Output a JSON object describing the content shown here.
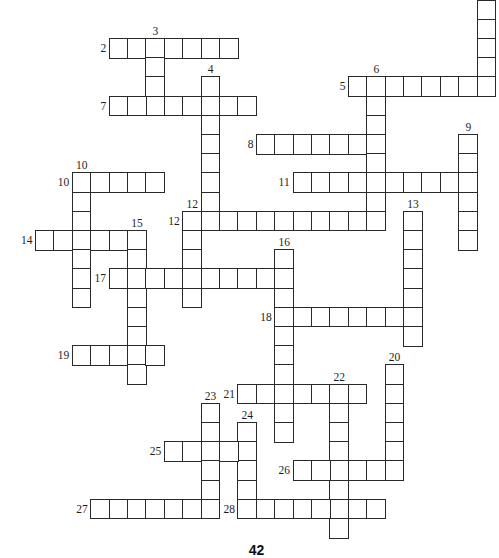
{
  "puzzle": {
    "type": "crossword",
    "page_number": "42",
    "grid": {
      "origin_x": 35,
      "origin_y": 38,
      "cell_w": 18.4,
      "cell_h": 19.2
    },
    "entries": [
      {
        "label": "2",
        "dir": "across",
        "row": 0,
        "col": 4,
        "len": 7
      },
      {
        "label": "3",
        "dir": "down",
        "row": 0,
        "col": 6,
        "len": 4
      },
      {
        "label": "",
        "dir": "down",
        "row": -2,
        "col": 24,
        "len": 5
      },
      {
        "label": "4",
        "dir": "down",
        "row": 2,
        "col": 9,
        "len": 8
      },
      {
        "label": "5",
        "dir": "across",
        "row": 2,
        "col": 17,
        "len": 8
      },
      {
        "label": "6",
        "dir": "down",
        "row": 2,
        "col": 18,
        "len": 8
      },
      {
        "label": "7",
        "dir": "across",
        "row": 3,
        "col": 4,
        "len": 8
      },
      {
        "label": "8",
        "dir": "across",
        "row": 5,
        "col": 12,
        "len": 7
      },
      {
        "label": "9",
        "dir": "down",
        "row": 5,
        "col": 23,
        "len": 6
      },
      {
        "label": "10",
        "dir": "across",
        "row": 7,
        "col": 2,
        "len": 5
      },
      {
        "label": "10",
        "dir": "down",
        "row": 7,
        "col": 2,
        "len": 7
      },
      {
        "label": "11",
        "dir": "across",
        "row": 7,
        "col": 14,
        "len": 10
      },
      {
        "label": "12",
        "dir": "across",
        "row": 9,
        "col": 8,
        "len": 11
      },
      {
        "label": "12",
        "dir": "down",
        "row": 9,
        "col": 8,
        "len": 5
      },
      {
        "label": "13",
        "dir": "down",
        "row": 9,
        "col": 20,
        "len": 7
      },
      {
        "label": "14",
        "dir": "across",
        "row": 10,
        "col": 0,
        "len": 6
      },
      {
        "label": "15",
        "dir": "down",
        "row": 10,
        "col": 5,
        "len": 8
      },
      {
        "label": "16",
        "dir": "down",
        "row": 11,
        "col": 13,
        "len": 10
      },
      {
        "label": "17",
        "dir": "across",
        "row": 12,
        "col": 4,
        "len": 10
      },
      {
        "label": "18",
        "dir": "across",
        "row": 14,
        "col": 13,
        "len": 8
      },
      {
        "label": "19",
        "dir": "across",
        "row": 16,
        "col": 2,
        "len": 5
      },
      {
        "label": "20",
        "dir": "down",
        "row": 17,
        "col": 19,
        "len": 6
      },
      {
        "label": "21",
        "dir": "across",
        "row": 18,
        "col": 11,
        "len": 7
      },
      {
        "label": "22",
        "dir": "down",
        "row": 18,
        "col": 16,
        "len": 8
      },
      {
        "label": "23",
        "dir": "down",
        "row": 19,
        "col": 9,
        "len": 6
      },
      {
        "label": "24",
        "dir": "down",
        "row": 20,
        "col": 11,
        "len": 5
      },
      {
        "label": "25",
        "dir": "across",
        "row": 21,
        "col": 7,
        "len": 5
      },
      {
        "label": "26",
        "dir": "across",
        "row": 22,
        "col": 14,
        "len": 6
      },
      {
        "label": "27",
        "dir": "across",
        "row": 24,
        "col": 3,
        "len": 7
      },
      {
        "label": "28",
        "dir": "across",
        "row": 24,
        "col": 11,
        "len": 8
      }
    ]
  }
}
